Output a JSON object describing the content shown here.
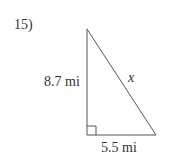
{
  "problem": {
    "number": "15)",
    "vertical_leg": "8.7 mi",
    "horizontal_leg": "5.5 mi",
    "hypotenuse": "x"
  },
  "colors": {
    "stroke": "#555555",
    "text": "#333333"
  }
}
